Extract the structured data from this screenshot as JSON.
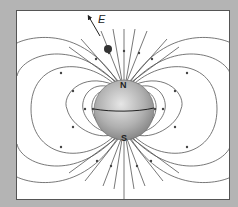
{
  "diagram": {
    "labels": {
      "north": "N",
      "south": "S",
      "field_vector": "E"
    },
    "colors": {
      "background": "#b4b4b4",
      "panel": "#ffffff",
      "field_line": "#555555",
      "sphere_light": "#e0e0e0",
      "sphere_dark": "#8a8a8a",
      "particle": "#333333"
    }
  }
}
